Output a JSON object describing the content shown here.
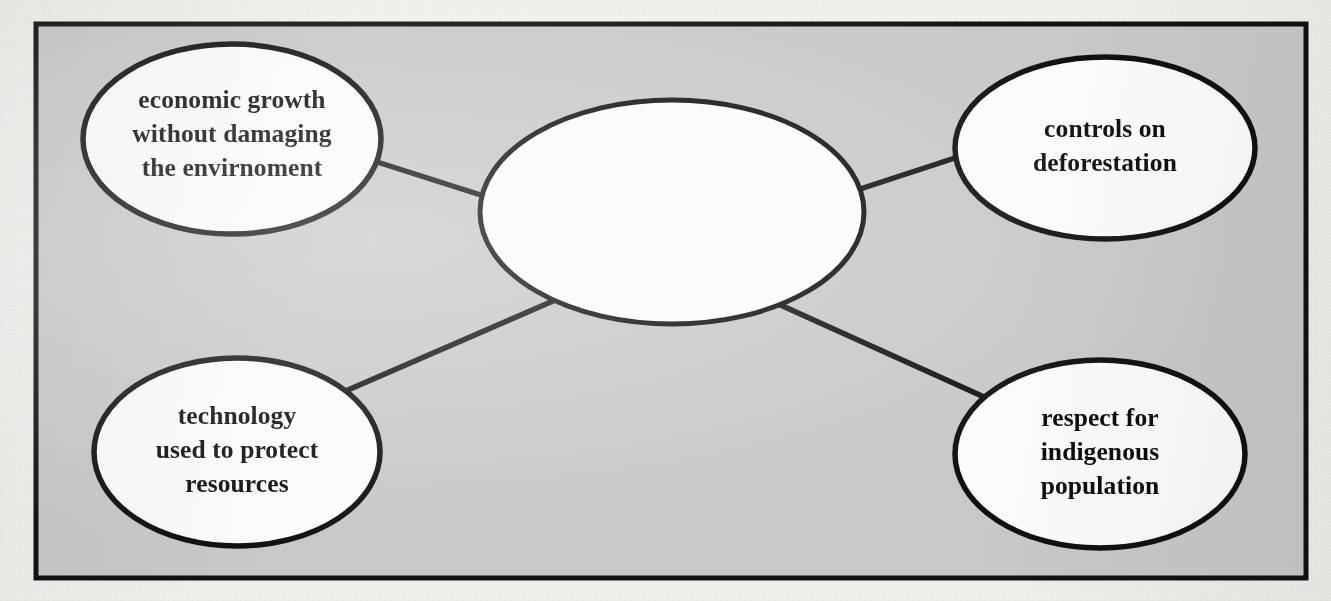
{
  "worksheet": {
    "type": "concept-map",
    "shape": "spider-diagram",
    "frame": {
      "border_color": "#121212",
      "fill_color": "#c8c8c8",
      "page_color": "#f3f2ee"
    },
    "center_node": {
      "id": "center",
      "label": "",
      "note": "blank ellipse to be filled in by student",
      "filled": false
    },
    "nodes": [
      {
        "id": "top-left",
        "position": "top-left",
        "lines": [
          "economic growth",
          "without damaging",
          "the envirnoment"
        ],
        "text": "economic growth without damaging the envirnoment"
      },
      {
        "id": "top-right",
        "position": "top-right",
        "lines": [
          "controls on",
          "deforestation"
        ],
        "text": "controls on deforestation"
      },
      {
        "id": "bottom-left",
        "position": "bottom-left",
        "lines": [
          "technology",
          "used to protect",
          "resources"
        ],
        "text": "technology used to protect resources"
      },
      {
        "id": "bottom-right",
        "position": "bottom-right",
        "lines": [
          "respect for",
          "indigenous",
          "population"
        ],
        "text": "respect for indigenous population"
      }
    ],
    "connectors": [
      {
        "id": "center-to-top-left",
        "from": "center",
        "to": "top-left"
      },
      {
        "id": "center-to-top-right",
        "from": "center",
        "to": "top-right"
      },
      {
        "id": "center-to-bottom-left",
        "from": "center",
        "to": "bottom-left"
      },
      {
        "id": "center-to-bottom-right",
        "from": "center",
        "to": "bottom-right"
      }
    ]
  }
}
